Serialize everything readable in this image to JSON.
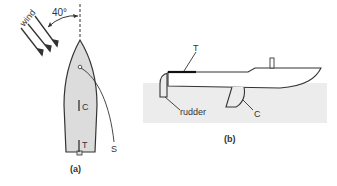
{
  "figure_a": {
    "caption": "(a)",
    "wind_label": "wind",
    "angle_label": "40°",
    "centre_label": "C",
    "tiller_label": "T",
    "sheet_label": "S"
  },
  "figure_b": {
    "caption": "(b)",
    "tiller_label": "T",
    "rudder_label": "rudder",
    "centreboard_label": "C"
  },
  "colors": {
    "hull_fill": "#dcdcdc",
    "water_fill": "#ececec",
    "stroke": "#333333",
    "tiller": "#111111"
  }
}
